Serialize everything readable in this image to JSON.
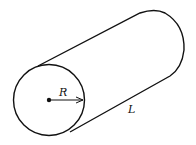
{
  "diagram": {
    "labels": {
      "radius": "R",
      "length": "L"
    },
    "colors": {
      "stroke": "#111111",
      "background": "#ffffff"
    }
  }
}
